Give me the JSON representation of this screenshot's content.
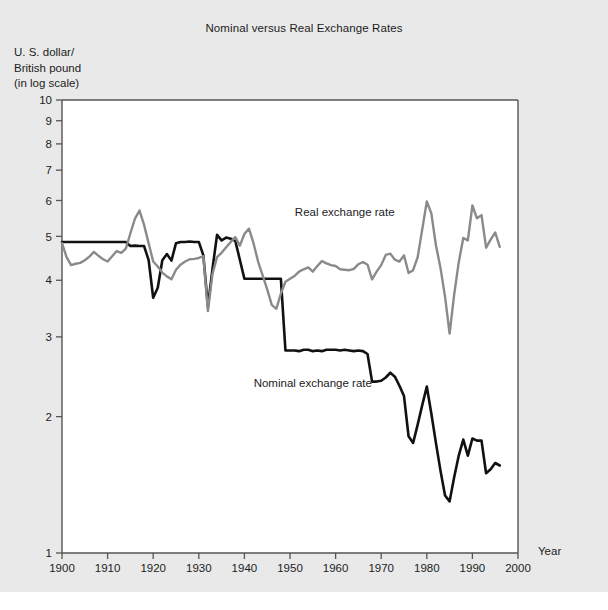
{
  "figure": {
    "background_color": "#e9e9e9",
    "plot_background_color": "#ffffff",
    "axis_color": "#555555"
  },
  "chart_data": {
    "type": "line",
    "title": "Nominal versus Real Exchange Rates",
    "ylabel": "U. S. dollar/\nBritish pound\n(in log scale)",
    "xlabel": "Year",
    "scale": "log-y",
    "grid": false,
    "legend_position": "inline-annotation",
    "xlim": [
      1900,
      2000
    ],
    "ylim": [
      1,
      10
    ],
    "xticks": [
      1900,
      1910,
      1920,
      1930,
      1940,
      1950,
      1960,
      1970,
      1980,
      1990,
      2000
    ],
    "xtick_labels": [
      "1900",
      "1910",
      "1920",
      "1930",
      "1940",
      "1950",
      "1960",
      "1970",
      "1980",
      "1990",
      "2000"
    ],
    "yticks": [
      1,
      2,
      3,
      4,
      5,
      6,
      7,
      8,
      9,
      10
    ],
    "ytick_labels": [
      "1",
      "2",
      "3",
      "4",
      "5",
      "6",
      "7",
      "8",
      "9",
      "10"
    ],
    "annotations": [
      {
        "text": "Real exchange rate",
        "x": 1962,
        "y": 5.55
      },
      {
        "text": "Nominal exchange rate",
        "x": 1955,
        "y": 2.33
      }
    ],
    "series": [
      {
        "name": "Nominal exchange rate",
        "label": "Nominal exchange rate",
        "color": "#111111",
        "width": 2.6,
        "x": [
          1900,
          1901,
          1902,
          1903,
          1904,
          1905,
          1906,
          1907,
          1908,
          1909,
          1910,
          1911,
          1912,
          1913,
          1914,
          1915,
          1916,
          1917,
          1918,
          1919,
          1920,
          1921,
          1922,
          1923,
          1924,
          1925,
          1926,
          1927,
          1928,
          1929,
          1930,
          1931,
          1932,
          1933,
          1934,
          1935,
          1936,
          1937,
          1938,
          1939,
          1940,
          1941,
          1942,
          1943,
          1944,
          1945,
          1946,
          1947,
          1948,
          1949,
          1950,
          1951,
          1952,
          1953,
          1954,
          1955,
          1956,
          1957,
          1958,
          1959,
          1960,
          1961,
          1962,
          1963,
          1964,
          1965,
          1966,
          1967,
          1968,
          1969,
          1970,
          1971,
          1972,
          1973,
          1974,
          1975,
          1976,
          1977,
          1978,
          1979,
          1980,
          1981,
          1982,
          1983,
          1984,
          1985,
          1986,
          1987,
          1988,
          1989,
          1990,
          1991,
          1992,
          1993,
          1994,
          1995,
          1996
        ],
        "y": [
          4.86,
          4.86,
          4.86,
          4.86,
          4.86,
          4.86,
          4.86,
          4.86,
          4.86,
          4.86,
          4.86,
          4.86,
          4.86,
          4.86,
          4.86,
          4.76,
          4.77,
          4.76,
          4.76,
          4.43,
          3.66,
          3.85,
          4.43,
          4.57,
          4.42,
          4.83,
          4.86,
          4.86,
          4.87,
          4.86,
          4.86,
          4.54,
          3.5,
          4.24,
          5.04,
          4.9,
          4.97,
          4.94,
          4.89,
          4.44,
          4.03,
          4.03,
          4.03,
          4.03,
          4.03,
          4.03,
          4.03,
          4.03,
          4.03,
          2.8,
          2.8,
          2.8,
          2.79,
          2.81,
          2.81,
          2.79,
          2.8,
          2.79,
          2.81,
          2.81,
          2.81,
          2.8,
          2.81,
          2.8,
          2.79,
          2.8,
          2.79,
          2.75,
          2.39,
          2.39,
          2.4,
          2.44,
          2.5,
          2.45,
          2.34,
          2.22,
          1.81,
          1.75,
          1.92,
          2.12,
          2.33,
          2.03,
          1.75,
          1.52,
          1.34,
          1.3,
          1.47,
          1.64,
          1.78,
          1.64,
          1.79,
          1.77,
          1.77,
          1.5,
          1.53,
          1.58,
          1.56
        ]
      },
      {
        "name": "Real exchange rate",
        "label": "Real exchange rate",
        "color": "#8a8a8a",
        "width": 2.4,
        "x": [
          1900,
          1901,
          1902,
          1903,
          1904,
          1905,
          1906,
          1907,
          1908,
          1909,
          1910,
          1911,
          1912,
          1913,
          1914,
          1915,
          1916,
          1917,
          1918,
          1919,
          1920,
          1921,
          1922,
          1923,
          1924,
          1925,
          1926,
          1927,
          1928,
          1929,
          1930,
          1931,
          1932,
          1933,
          1934,
          1935,
          1936,
          1937,
          1938,
          1939,
          1940,
          1941,
          1942,
          1943,
          1944,
          1945,
          1946,
          1947,
          1948,
          1949,
          1950,
          1951,
          1952,
          1953,
          1954,
          1955,
          1956,
          1957,
          1958,
          1959,
          1960,
          1961,
          1962,
          1963,
          1964,
          1965,
          1966,
          1967,
          1968,
          1969,
          1970,
          1971,
          1972,
          1973,
          1974,
          1975,
          1976,
          1977,
          1978,
          1979,
          1980,
          1981,
          1982,
          1983,
          1984,
          1985,
          1986,
          1987,
          1988,
          1989,
          1990,
          1991,
          1992,
          1993,
          1994,
          1995,
          1996
        ],
        "y": [
          4.83,
          4.5,
          4.32,
          4.35,
          4.37,
          4.43,
          4.51,
          4.62,
          4.53,
          4.45,
          4.4,
          4.52,
          4.64,
          4.6,
          4.7,
          5.08,
          5.47,
          5.7,
          5.3,
          4.83,
          4.4,
          4.29,
          4.16,
          4.08,
          4.02,
          4.22,
          4.33,
          4.4,
          4.45,
          4.46,
          4.48,
          4.52,
          3.42,
          4.13,
          4.5,
          4.6,
          4.73,
          4.86,
          4.98,
          4.77,
          5.06,
          5.2,
          4.83,
          4.4,
          4.1,
          3.82,
          3.53,
          3.46,
          3.74,
          3.97,
          4.03,
          4.09,
          4.18,
          4.23,
          4.27,
          4.18,
          4.3,
          4.41,
          4.36,
          4.32,
          4.3,
          4.23,
          4.22,
          4.21,
          4.24,
          4.34,
          4.39,
          4.33,
          4.02,
          4.18,
          4.32,
          4.55,
          4.58,
          4.44,
          4.4,
          4.54,
          4.15,
          4.21,
          4.5,
          5.18,
          5.97,
          5.62,
          4.78,
          4.26,
          3.68,
          3.05,
          3.72,
          4.38,
          4.96,
          4.9,
          5.85,
          5.48,
          5.57,
          4.72,
          4.92,
          5.1,
          4.74
        ]
      }
    ]
  }
}
